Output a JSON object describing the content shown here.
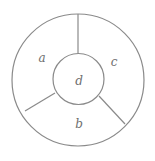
{
  "diagram": {
    "type": "annular-region-partition",
    "outer_circle": {
      "cx": 78,
      "cy": 80,
      "r": 66
    },
    "inner_circle": {
      "cx": 78.5,
      "cy": 79,
      "r": 25.5
    },
    "dividers": [
      {
        "x1": 78,
        "y1": 14,
        "x2": 78,
        "y2": 53.5
      },
      {
        "x1": 55,
        "y1": 93,
        "x2": 25,
        "y2": 111
      },
      {
        "x1": 99,
        "y1": 96,
        "x2": 125,
        "y2": 124
      }
    ],
    "stroke_color": "#8a8a8a",
    "label_color": "#6e6e6e",
    "regions": [
      {
        "id": "a",
        "label": "a",
        "x": 42,
        "y": 58
      },
      {
        "id": "b",
        "label": "b",
        "x": 79,
        "y": 124
      },
      {
        "id": "c",
        "label": "c",
        "x": 114,
        "y": 62
      },
      {
        "id": "d",
        "label": "d",
        "x": 79,
        "y": 81
      }
    ]
  }
}
